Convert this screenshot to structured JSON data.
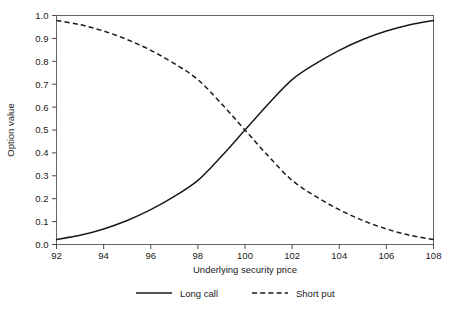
{
  "chart_data": {
    "type": "line",
    "title": "",
    "xlabel": "Underlying security price",
    "ylabel": "Option value",
    "xlim": [
      92,
      108
    ],
    "ylim": [
      0.0,
      1.0
    ],
    "grid": false,
    "legend_position": "bottom-center",
    "xticks": [
      92,
      94,
      96,
      98,
      100,
      102,
      104,
      106,
      108
    ],
    "xtick_labels": [
      "92",
      "94",
      "96",
      "98",
      "100",
      "102",
      "104",
      "106",
      "108"
    ],
    "yticks": [
      0.0,
      0.1,
      0.2,
      0.3,
      0.4,
      0.5,
      0.6,
      0.7,
      0.8,
      0.9,
      1.0
    ],
    "ytick_labels": [
      "0.0",
      "0.1",
      "0.2",
      "0.3",
      "0.4",
      "0.5",
      "0.6",
      "0.7",
      "0.8",
      "0.9",
      "1.0"
    ],
    "x": [
      92,
      93,
      94,
      95,
      96,
      97,
      98,
      99,
      100,
      101,
      102,
      103,
      104,
      105,
      106,
      107,
      108
    ],
    "series": [
      {
        "name": "Long call",
        "style": "solid",
        "color": "#1a1a1a",
        "values": [
          0.022,
          0.04,
          0.068,
          0.105,
          0.152,
          0.21,
          0.28,
          0.385,
          0.5,
          0.615,
          0.72,
          0.79,
          0.848,
          0.895,
          0.932,
          0.96,
          0.978
        ]
      },
      {
        "name": "Short put",
        "style": "dashed",
        "color": "#1a1a1a",
        "values": [
          0.978,
          0.96,
          0.932,
          0.895,
          0.848,
          0.79,
          0.72,
          0.615,
          0.5,
          0.385,
          0.28,
          0.21,
          0.152,
          0.105,
          0.068,
          0.04,
          0.022
        ]
      }
    ],
    "annotations": []
  },
  "legend": {
    "entries": [
      {
        "label": "Long call",
        "style": "solid"
      },
      {
        "label": "Short put",
        "style": "dashed"
      }
    ]
  },
  "axes": {
    "x_title": "Underlying security price",
    "y_title": "Option value"
  }
}
